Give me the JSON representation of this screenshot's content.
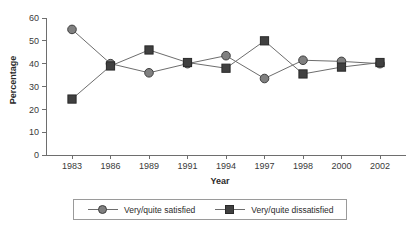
{
  "chart_data": {
    "type": "line",
    "title": "",
    "xlabel": "Year",
    "ylabel": "Percentage",
    "categories": [
      "1983",
      "1986",
      "1989",
      "1991",
      "1994",
      "1997",
      "1998",
      "2000",
      "2002"
    ],
    "ylim": [
      0,
      60
    ],
    "yticks": [
      0,
      10,
      20,
      30,
      40,
      50,
      60
    ],
    "ytick_labels": [
      "0",
      "10",
      "20",
      "30",
      "40",
      "50",
      "60"
    ],
    "grid": false,
    "legend_position": "bottom",
    "series": [
      {
        "name": "Very/quite satisfied",
        "marker": "circle",
        "color": "#808080",
        "values": [
          55,
          40,
          36,
          40,
          43.5,
          33.5,
          41.5,
          41,
          40
        ]
      },
      {
        "name": "Very/quite dissatisfied",
        "marker": "square",
        "color": "#404040",
        "values": [
          24.5,
          39,
          46,
          40.5,
          38,
          50,
          35.5,
          38.5,
          40.5
        ]
      }
    ]
  },
  "axes": {
    "y_title": "Percentage",
    "x_title": "Year"
  },
  "legend": {
    "items": [
      {
        "label": "Very/quite satisfied",
        "marker": "circle-marker-icon"
      },
      {
        "label": "Very/quite dissatisfied",
        "marker": "square-marker-icon"
      }
    ]
  }
}
